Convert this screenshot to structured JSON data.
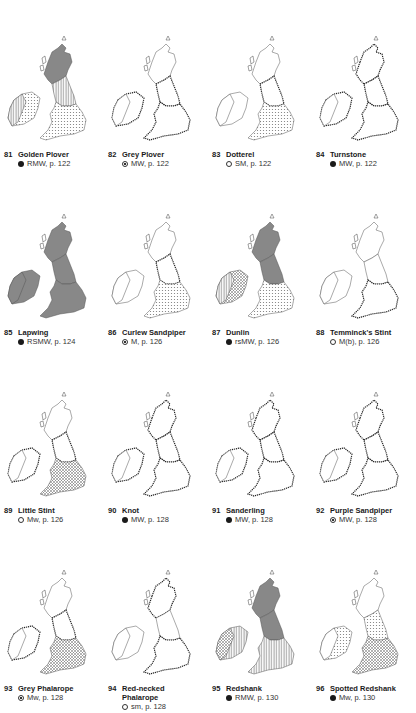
{
  "page": {
    "species": [
      {
        "number": "81",
        "name": "Golden Plover",
        "name2": "",
        "symbol": "filled",
        "status": "RMW, p. 122",
        "fills": {
          "scot": "dark",
          "north": "vlines",
          "south": "dots",
          "ireland": "dots",
          "ireland_west": "vlines"
        }
      },
      {
        "number": "82",
        "name": "Grey Plover",
        "name2": "",
        "symbol": "dotted",
        "status": "MW, p. 122",
        "fills": {
          "scot": "none",
          "north": "coast",
          "south": "coast",
          "ireland": "coast",
          "ireland_west": "none"
        }
      },
      {
        "number": "83",
        "name": "Dotterel",
        "name2": "",
        "symbol": "open",
        "status": "SM, p. 122",
        "fills": {
          "scot": "none",
          "north": "coast",
          "south": "dots",
          "ireland": "none",
          "ireland_west": "none"
        }
      },
      {
        "number": "84",
        "name": "Turnstone",
        "name2": "",
        "symbol": "filled",
        "status": "MW, p. 122",
        "fills": {
          "scot": "coast",
          "north": "coast",
          "south": "coast",
          "ireland": "coast",
          "ireland_west": "none"
        }
      },
      {
        "number": "85",
        "name": "Lapwing",
        "name2": "",
        "symbol": "filled",
        "status": "RSMW, p. 124",
        "fills": {
          "scot": "dark",
          "north": "dark",
          "south": "dark",
          "ireland": "dark",
          "ireland_west": "dark"
        }
      },
      {
        "number": "86",
        "name": "Curlew Sandpiper",
        "name2": "",
        "symbol": "dotted",
        "status": "M, p. 126",
        "fills": {
          "scot": "none",
          "north": "coast",
          "south": "dots",
          "ireland": "none",
          "ireland_west": "none"
        }
      },
      {
        "number": "87",
        "name": "Dunlin",
        "name2": "",
        "symbol": "filled",
        "status": "rsMW, p. 126",
        "fills": {
          "scot": "dark",
          "north": "dark",
          "south": "dots",
          "ireland": "hatch",
          "ireland_west": "vlines"
        }
      },
      {
        "number": "88",
        "name": "Temminck's Stint",
        "name2": "",
        "symbol": "open",
        "status": "M(b), p. 126",
        "fills": {
          "scot": "none",
          "north": "none",
          "south": "coast",
          "ireland": "none",
          "ireland_west": "none"
        }
      },
      {
        "number": "89",
        "name": "Little Stint",
        "name2": "",
        "symbol": "open",
        "status": "Mw, p. 126",
        "fills": {
          "scot": "none",
          "north": "coast",
          "south": "hatch",
          "ireland": "coast",
          "ireland_west": "none"
        }
      },
      {
        "number": "90",
        "name": "Knot",
        "name2": "",
        "symbol": "filled",
        "status": "MW, p. 128",
        "fills": {
          "scot": "coast",
          "north": "coast",
          "south": "coast",
          "ireland": "coast",
          "ireland_west": "none"
        }
      },
      {
        "number": "91",
        "name": "Sanderling",
        "name2": "",
        "symbol": "filled",
        "status": "MW, p. 128",
        "fills": {
          "scot": "coast",
          "north": "coast",
          "south": "coast",
          "ireland": "coast",
          "ireland_west": "none"
        }
      },
      {
        "number": "92",
        "name": "Purple Sandpiper",
        "name2": "",
        "symbol": "dotted",
        "status": "MW, p. 128",
        "fills": {
          "scot": "coast",
          "north": "coast",
          "south": "coast",
          "ireland": "coast",
          "ireland_west": "none"
        }
      },
      {
        "number": "93",
        "name": "Grey Phalarope",
        "name2": "",
        "symbol": "dotted",
        "status": "Mw, p. 128",
        "fills": {
          "scot": "none",
          "north": "coast",
          "south": "hatch",
          "ireland": "coast",
          "ireland_west": "none"
        }
      },
      {
        "number": "94",
        "name": "Red-necked",
        "name2": "Phalarope",
        "symbol": "open",
        "status": "sm, p. 128",
        "fills": {
          "scot": "coast",
          "north": "none",
          "south": "coast",
          "ireland": "none",
          "ireland_west": "none"
        }
      },
      {
        "number": "95",
        "name": "Redshank",
        "name2": "",
        "symbol": "filled",
        "status": "RMW, p. 130",
        "fills": {
          "scot": "dark",
          "north": "dark",
          "south": "vlines",
          "ireland": "vlines",
          "ireland_west": "hatch"
        }
      },
      {
        "number": "96",
        "name": "Spotted Redshank",
        "name2": "",
        "symbol": "filled",
        "status": "Mw, p. 130",
        "fills": {
          "scot": "none",
          "north": "dots",
          "south": "hatch",
          "ireland": "dots",
          "ireland_west": "none"
        }
      }
    ]
  }
}
